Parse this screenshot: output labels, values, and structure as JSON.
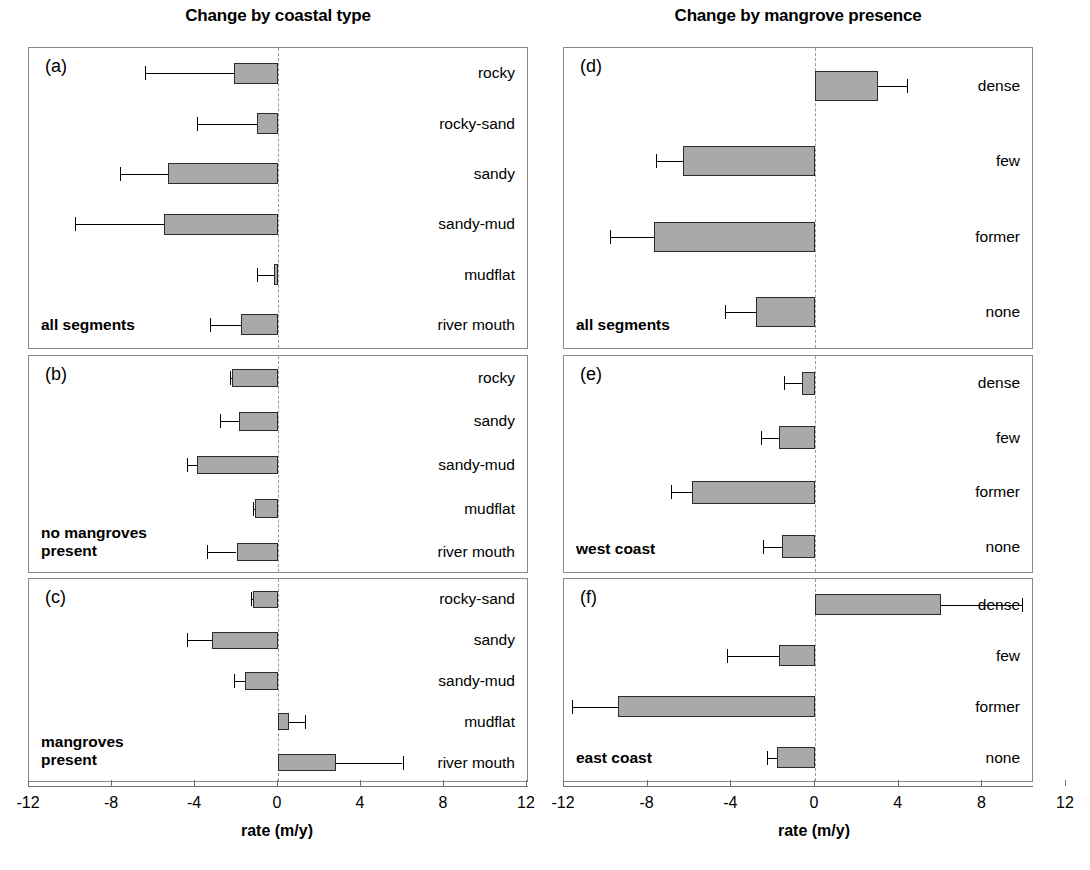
{
  "figure": {
    "column_titles": [
      {
        "text": "Change by coastal type"
      },
      {
        "text": "Change by mangrove presence"
      }
    ],
    "axis_title": "rate (m/y)",
    "tick_labels": [
      "-12",
      "-8",
      "-4",
      "0",
      "4",
      "8",
      "12"
    ],
    "bar_fill": "#a9a9a9",
    "bar_stroke": "#2b2b2b"
  },
  "chart_data": {
    "type": "bar",
    "xlabel": "rate (m/y)",
    "ylabel": "",
    "xlim": [
      -12,
      12
    ],
    "xticks": [
      -12,
      -8,
      -4,
      0,
      4,
      8,
      12
    ],
    "orientation": "horizontal",
    "grid": false,
    "legend": "none",
    "errorbars": "one-sided (extends away from zero)",
    "panels": [
      {
        "key": "(a)",
        "column": "Change by coastal type",
        "note": "all segments",
        "categories": [
          "rocky",
          "rocky-sand",
          "sandy",
          "sandy-mud",
          "mudflat",
          "river mouth"
        ],
        "values": [
          -2.1,
          -1.0,
          -5.3,
          -5.5,
          -0.2,
          -1.8
        ],
        "error_to": [
          -6.4,
          -3.9,
          -7.6,
          -9.8,
          -1.0,
          -3.3
        ]
      },
      {
        "key": "(b)",
        "column": "Change by coastal type",
        "note": "no mangroves present",
        "categories": [
          "rocky",
          "sandy",
          "sandy-mud",
          "mudflat",
          "river mouth"
        ],
        "values": [
          -2.2,
          -1.9,
          -3.9,
          -1.1,
          -2.0
        ],
        "error_to": [
          -2.3,
          -2.8,
          -4.4,
          -1.2,
          -3.4
        ]
      },
      {
        "key": "(c)",
        "column": "Change by coastal type",
        "note": "mangroves present",
        "categories": [
          "rocky-sand",
          "sandy",
          "sandy-mud",
          "mudflat",
          "river mouth"
        ],
        "values": [
          -1.2,
          -3.2,
          -1.6,
          0.55,
          2.8
        ],
        "error_to": [
          -1.3,
          -4.4,
          -2.1,
          1.3,
          6.0
        ]
      },
      {
        "key": "(d)",
        "column": "Change by mangrove presence",
        "note": "all segments",
        "categories": [
          "dense",
          "few",
          "former",
          "none"
        ],
        "values": [
          3.0,
          -6.3,
          -7.7,
          -2.8
        ],
        "error_to": [
          4.4,
          -7.6,
          -9.8,
          -4.3
        ]
      },
      {
        "key": "(e)",
        "column": "Change by mangrove presence",
        "note": "west coast",
        "categories": [
          "dense",
          "few",
          "former",
          "none"
        ],
        "values": [
          -0.6,
          -1.7,
          -5.9,
          -1.6
        ],
        "error_to": [
          -1.5,
          -2.6,
          -6.9,
          -2.5
        ]
      },
      {
        "key": "(f)",
        "column": "Change by mangrove presence",
        "note": "east coast",
        "categories": [
          "dense",
          "few",
          "former",
          "none"
        ],
        "values": [
          6.0,
          -1.7,
          -9.4,
          -1.8
        ],
        "error_to": [
          9.9,
          -4.2,
          -11.6,
          -2.3
        ]
      }
    ]
  }
}
